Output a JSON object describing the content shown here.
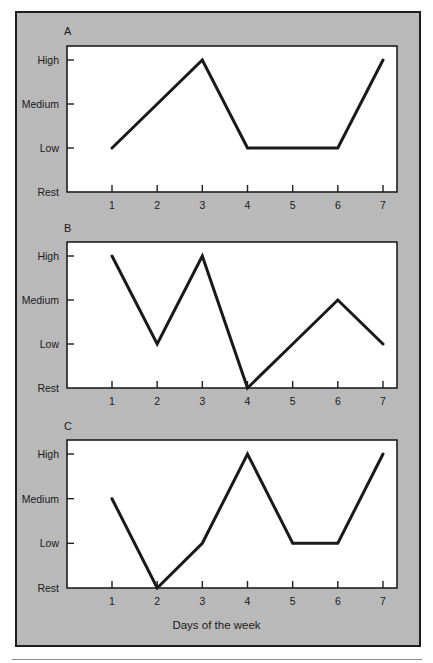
{
  "chart_data": {
    "type": "line",
    "xlabel": "Days of the week",
    "x": [
      1,
      2,
      3,
      4,
      5,
      6,
      7
    ],
    "y_levels": [
      "Rest",
      "Low",
      "Medium",
      "High"
    ],
    "y_level_values": {
      "Rest": 0,
      "Low": 1,
      "Medium": 2,
      "High": 3
    },
    "grid": false,
    "line_color": "#1a1a1a",
    "panel_background": "#b9b9b9",
    "plot_background": "#ffffff",
    "panels": [
      {
        "label": "A",
        "values": [
          1,
          2,
          3,
          1,
          1,
          1,
          3
        ],
        "value_labels": [
          "Low",
          "Medium",
          "High",
          "Low",
          "Low",
          "Low",
          "High"
        ]
      },
      {
        "label": "B",
        "values": [
          3,
          1,
          3,
          0,
          1,
          2,
          1
        ],
        "value_labels": [
          "High",
          "Low",
          "High",
          "Rest",
          "Low",
          "Medium",
          "Low"
        ]
      },
      {
        "label": "C",
        "values": [
          2,
          0,
          1,
          3,
          1,
          1,
          3
        ],
        "value_labels": [
          "Medium",
          "Rest",
          "Low",
          "High",
          "Low",
          "Low",
          "High"
        ]
      }
    ]
  }
}
